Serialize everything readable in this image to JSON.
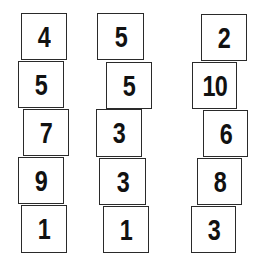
{
  "columns": [
    {
      "cards": [
        {
          "value": "4",
          "x": 21,
          "y": 13,
          "w": 46,
          "h": 47
        },
        {
          "value": "5",
          "x": 18,
          "y": 61,
          "w": 46,
          "h": 47
        },
        {
          "value": "7",
          "x": 23,
          "y": 109,
          "w": 46,
          "h": 47
        },
        {
          "value": "9",
          "x": 18,
          "y": 157,
          "w": 46,
          "h": 47
        },
        {
          "value": "1",
          "x": 21,
          "y": 205,
          "w": 46,
          "h": 48
        }
      ]
    },
    {
      "cards": [
        {
          "value": "5",
          "x": 97,
          "y": 13,
          "w": 47,
          "h": 47
        },
        {
          "value": "5",
          "x": 106,
          "y": 62,
          "w": 46,
          "h": 47
        },
        {
          "value": "3",
          "x": 96,
          "y": 109,
          "w": 46,
          "h": 48
        },
        {
          "value": "3",
          "x": 99,
          "y": 158,
          "w": 47,
          "h": 47
        },
        {
          "value": "1",
          "x": 103,
          "y": 206,
          "w": 46,
          "h": 47
        }
      ]
    },
    {
      "cards": [
        {
          "value": "2",
          "x": 201,
          "y": 14,
          "w": 46,
          "h": 47
        },
        {
          "value": "10",
          "x": 192,
          "y": 62,
          "w": 45,
          "h": 47
        },
        {
          "value": "6",
          "x": 203,
          "y": 110,
          "w": 45,
          "h": 47
        },
        {
          "value": "8",
          "x": 197,
          "y": 158,
          "w": 45,
          "h": 47
        },
        {
          "value": "3",
          "x": 191,
          "y": 206,
          "w": 45,
          "h": 47
        }
      ]
    }
  ]
}
